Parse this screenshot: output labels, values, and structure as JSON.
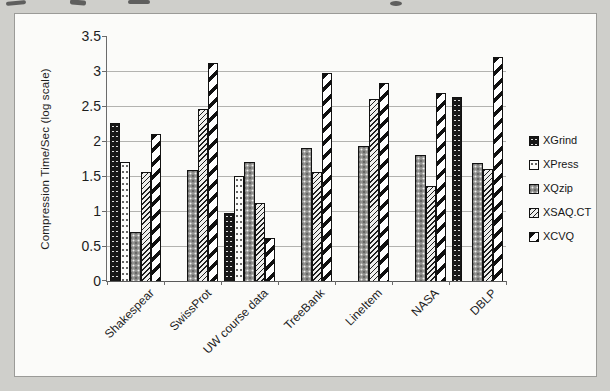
{
  "figure": {
    "page_background": "#cfcfcb",
    "panel_background": "#fbfbf9",
    "panel_border": "#9b9b98",
    "gridline_color": "#b3b3b0",
    "text_color": "#1d1d1d"
  },
  "chart_data": {
    "type": "bar",
    "title": "",
    "xlabel": "",
    "ylabel": "Compression Time/Sec (log scale)",
    "ylim": [
      0,
      3.5
    ],
    "ytick_step": 0.5,
    "yticks": [
      3.5,
      3,
      2.5,
      2,
      1.5,
      1,
      0.5,
      0
    ],
    "grid": true,
    "legend_position": "right",
    "categories": [
      "Shakespear",
      "SwissProt",
      "UW course data",
      "TreeBank",
      "LineItem",
      "NASA",
      "DBLP"
    ],
    "series": [
      {
        "name": "XGrind",
        "pattern": "black-speckled",
        "values": [
          2.25,
          0,
          0.97,
          0,
          0,
          0,
          2.63
        ]
      },
      {
        "name": "XPress",
        "pattern": "white-dotted",
        "values": [
          1.7,
          0,
          1.5,
          0,
          0,
          0,
          0
        ]
      },
      {
        "name": "XQzip",
        "pattern": "gray-speckled",
        "values": [
          0.7,
          1.58,
          1.7,
          1.9,
          1.93,
          1.8,
          1.68
        ]
      },
      {
        "name": "XSAQ.CT",
        "pattern": "fine-diagonal-hatch",
        "values": [
          1.55,
          2.46,
          1.12,
          1.55,
          2.6,
          1.35,
          1.6
        ]
      },
      {
        "name": "XCVQ",
        "pattern": "wide-diagonal-stripe",
        "values": [
          2.1,
          3.11,
          0.62,
          2.97,
          2.83,
          2.69,
          3.2
        ]
      }
    ]
  }
}
